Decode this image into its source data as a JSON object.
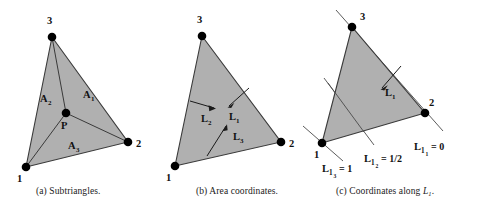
{
  "figure": {
    "background_color": "#ffffff",
    "fill_color": "#b0b0b0",
    "stroke_color": "#3a3a3a",
    "text_color": "#1a1a1a",
    "panels": [
      {
        "id": "a",
        "caption_prefix": "(a)",
        "caption_text": "Subtriangles.",
        "vertices": [
          {
            "label": "1",
            "x": 26,
            "y": 167
          },
          {
            "label": "2",
            "x": 128,
            "y": 142
          },
          {
            "label": "3",
            "x": 52,
            "y": 37
          }
        ],
        "interior_point": {
          "label": "P",
          "x": 66,
          "y": 113
        },
        "area_labels": [
          {
            "text": "A",
            "sub": "1",
            "x": 87,
            "y": 94
          },
          {
            "text": "A",
            "sub": "2",
            "x": 44,
            "y": 98
          },
          {
            "text": "A",
            "sub": "3",
            "x": 72,
            "y": 145
          }
        ]
      },
      {
        "id": "b",
        "caption_prefix": "(b)",
        "caption_text": "Area coordinates.",
        "vertices": [
          {
            "label": "1",
            "x": 175,
            "y": 166
          },
          {
            "label": "2",
            "x": 281,
            "y": 142
          },
          {
            "label": "3",
            "x": 202,
            "y": 36
          }
        ],
        "coord_labels": [
          {
            "text": "L",
            "sub": "1",
            "x": 232,
            "y": 113
          },
          {
            "text": "L",
            "sub": "2",
            "x": 205,
            "y": 115
          },
          {
            "text": "L",
            "sub": "3",
            "x": 237,
            "y": 135
          }
        ]
      },
      {
        "id": "c",
        "caption_prefix": "(c)",
        "caption_text": "Coordinates along",
        "caption_symbol": "L",
        "caption_symbol_sub": "1",
        "caption_suffix": ".",
        "vertices": [
          {
            "label": "1",
            "x": 322,
            "y": 143
          },
          {
            "label": "2",
            "x": 425,
            "y": 113
          },
          {
            "label": "3",
            "x": 352,
            "y": 27
          }
        ],
        "gradient_label": {
          "text": "L",
          "sub": "1",
          "x": 388,
          "y": 87
        },
        "level_lines": [
          {
            "text": "L",
            "sub": "1",
            "subsub": "3",
            "value": "= 1",
            "x": 328,
            "y": 166
          },
          {
            "text": "L",
            "sub": "1",
            "subsub": "2",
            "value": "= 1/2",
            "x": 372,
            "y": 156
          },
          {
            "text": "L",
            "sub": "1",
            "subsub": "1",
            "value": "= 0",
            "x": 424,
            "y": 142
          }
        ]
      }
    ]
  }
}
